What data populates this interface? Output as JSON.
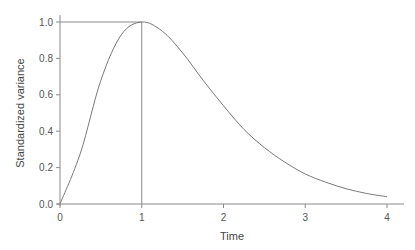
{
  "chart_data": {
    "type": "line",
    "title": "",
    "xlabel": "Time",
    "ylabel": "Standardized variance",
    "xlim": [
      0,
      4
    ],
    "ylim": [
      0,
      1.0
    ],
    "x_ticks": [
      "0",
      "1",
      "2",
      "3",
      "4"
    ],
    "y_ticks": [
      "0.0",
      "0.2",
      "0.4",
      "0.6",
      "0.8",
      "1.0"
    ],
    "grid": false,
    "legend": null,
    "series": [
      {
        "name": "standardized variance",
        "x": [
          0,
          0.25,
          0.5,
          0.75,
          1.0,
          1.25,
          1.5,
          1.75,
          2.0,
          2.25,
          2.5,
          2.75,
          3.0,
          3.25,
          3.5,
          3.75,
          4.0
        ],
        "values": [
          0.0,
          0.28,
          0.68,
          0.93,
          1.0,
          0.95,
          0.83,
          0.68,
          0.54,
          0.41,
          0.31,
          0.23,
          0.165,
          0.12,
          0.084,
          0.058,
          0.04
        ]
      }
    ],
    "annotations": [
      {
        "type": "hline",
        "y": 1.0,
        "from_x": 0,
        "to_x": 1,
        "label": "peak level"
      },
      {
        "type": "vline",
        "x": 1.0,
        "from_y": 0,
        "to_y": 1.0,
        "label": "peak time"
      }
    ]
  }
}
